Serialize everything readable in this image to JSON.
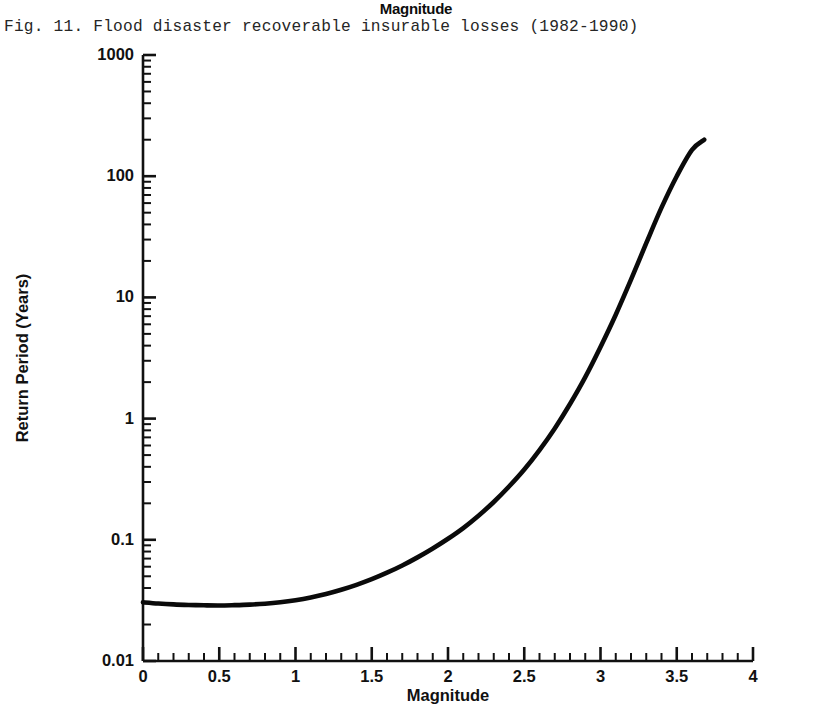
{
  "stray_label": "Magnitude",
  "caption": "Fig. 11. Flood disaster recoverable insurable losses (1982-1990)",
  "axis_titles": {
    "x": "Magnitude",
    "y": "Return Period (Years)"
  },
  "colors": {
    "ink": "#111111",
    "curve": "#0a0a0a",
    "background": "#ffffff"
  },
  "chart_data": {
    "type": "line",
    "title": "Flood disaster recoverable insurable losses (1982-1990)",
    "xlabel": "Magnitude",
    "ylabel": "Return Period (Years)",
    "xlim": [
      0,
      4
    ],
    "ylim": [
      0.01,
      1000
    ],
    "yscale": "log",
    "xscale": "linear",
    "grid": false,
    "legend": null,
    "xticks": [
      0,
      0.5,
      1,
      1.5,
      2,
      2.5,
      3,
      3.5,
      4
    ],
    "xtick_labels": [
      "0",
      "0.5",
      "1",
      "1.5",
      "2",
      "2.5",
      "3",
      "3.5",
      "4"
    ],
    "x_minor_tick_step": 0.1,
    "yticks": [
      0.01,
      0.1,
      1,
      10,
      100,
      1000
    ],
    "ytick_labels": [
      "0.01",
      "0.1",
      "1",
      "10",
      "100",
      "1000"
    ],
    "y_minor_ticks_per_decade": 9,
    "series": [
      {
        "name": "Return period vs magnitude",
        "x": [
          0.0,
          0.1,
          0.2,
          0.3,
          0.4,
          0.5,
          0.6,
          0.7,
          0.8,
          0.9,
          1.0,
          1.1,
          1.2,
          1.3,
          1.4,
          1.5,
          1.6,
          1.7,
          1.8,
          1.9,
          2.0,
          2.1,
          2.2,
          2.3,
          2.4,
          2.5,
          2.6,
          2.7,
          2.8,
          2.9,
          3.0,
          3.1,
          3.2,
          3.3,
          3.4,
          3.5,
          3.6,
          3.68
        ],
        "y": [
          0.0305,
          0.0298,
          0.0293,
          0.029,
          0.0288,
          0.0287,
          0.0289,
          0.0292,
          0.0297,
          0.0305,
          0.0317,
          0.0334,
          0.0357,
          0.0387,
          0.0425,
          0.0473,
          0.0535,
          0.0614,
          0.0716,
          0.0848,
          0.102,
          0.125,
          0.158,
          0.205,
          0.275,
          0.38,
          0.55,
          0.83,
          1.32,
          2.2,
          3.9,
          7.2,
          14.0,
          28.0,
          55.0,
          100.0,
          165.0,
          200.0
        ]
      }
    ],
    "annotations": []
  }
}
